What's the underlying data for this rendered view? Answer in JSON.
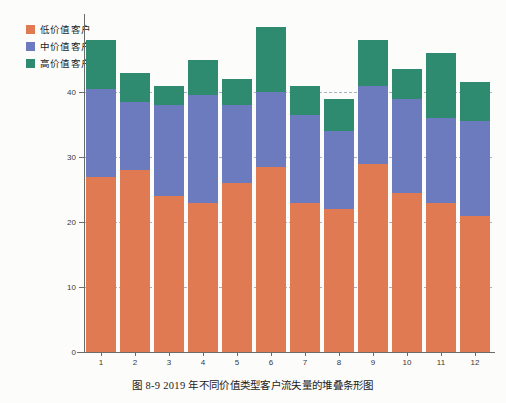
{
  "caption": "图 8-9   2019 年不同价值类型客户流失量的堆叠条形图",
  "legend": {
    "position": "top-left",
    "items": [
      {
        "label": "低价值客户",
        "color": "#e07a52",
        "key": "low"
      },
      {
        "label": "中价值客户",
        "color": "#6b7bbd",
        "key": "mid"
      },
      {
        "label": "高价值客户",
        "color": "#2e8b6f",
        "key": "high"
      }
    ]
  },
  "chart_data": {
    "type": "bar",
    "stacked": true,
    "title": "",
    "xlabel": "",
    "ylabel": "",
    "categories": [
      "1",
      "2",
      "3",
      "4",
      "5",
      "6",
      "7",
      "8",
      "9",
      "10",
      "11",
      "12"
    ],
    "ylim": [
      0,
      52
    ],
    "yticks": [
      0,
      10,
      20,
      30,
      40
    ],
    "grid": true,
    "series": [
      {
        "name": "低价值客户",
        "color": "#e07a52",
        "values": [
          27,
          28,
          24,
          23,
          26,
          28.5,
          23,
          22,
          29,
          24.5,
          23,
          21
        ]
      },
      {
        "name": "中价值客户",
        "color": "#6b7bbd",
        "values": [
          13.5,
          10.5,
          14,
          16.5,
          12,
          11.5,
          13.5,
          12,
          12,
          14.5,
          13,
          14.5
        ]
      },
      {
        "name": "高价值客户",
        "color": "#2e8b6f",
        "values": [
          7.5,
          4.5,
          3,
          5.5,
          4,
          10,
          4.5,
          5,
          7,
          4.5,
          10,
          6
        ]
      }
    ],
    "totals": [
      48,
      43,
      41,
      45,
      42,
      50,
      41,
      39,
      48,
      43.5,
      46,
      41.5
    ]
  }
}
